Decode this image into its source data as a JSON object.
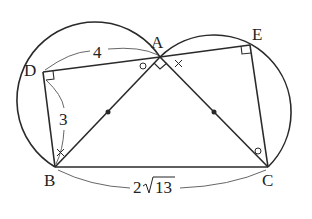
{
  "diagram": {
    "points": {
      "A": {
        "label": "A",
        "x": 160,
        "y": 57
      },
      "B": {
        "label": "B",
        "x": 55,
        "y": 167
      },
      "C": {
        "label": "C",
        "x": 268,
        "y": 167
      },
      "D": {
        "label": "D",
        "x": 43,
        "y": 72
      },
      "E": {
        "label": "E",
        "x": 250,
        "y": 45
      }
    },
    "measurements": {
      "DA": "4",
      "DB": "3",
      "BC_coef": "2",
      "BC_rad": "13"
    },
    "markers": {
      "right_angles": [
        "D",
        "E",
        "A"
      ],
      "circle_mark": "○",
      "cross_mark": "×"
    },
    "stroke_color": "#2a2a2a",
    "background": "#ffffff"
  }
}
